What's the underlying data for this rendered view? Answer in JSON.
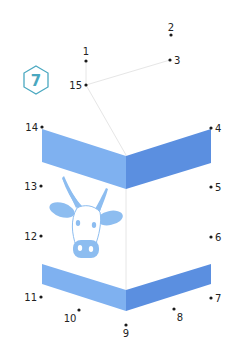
{
  "puzzle": {
    "badge_number": "7",
    "badge_color": "#4aa8c0",
    "dot_color": "#1a1a1a",
    "label_color": "#222222",
    "guide_line_color": "#e6e6e6",
    "band_left_color": "#7fb1f0",
    "band_right_color": "#5b8fe0",
    "cow_color": "#8dbdf0",
    "dots": [
      {
        "n": "1",
        "x": 86,
        "y": 61,
        "lx": 86,
        "ly": 55,
        "anchor": "middle"
      },
      {
        "n": "2",
        "x": 171,
        "y": 35,
        "lx": 171,
        "ly": 31,
        "anchor": "middle"
      },
      {
        "n": "3",
        "x": 170,
        "y": 60,
        "lx": 174,
        "ly": 64,
        "anchor": "start"
      },
      {
        "n": "4",
        "x": 211,
        "y": 128,
        "lx": 215,
        "ly": 132,
        "anchor": "start"
      },
      {
        "n": "5",
        "x": 211,
        "y": 187,
        "lx": 215,
        "ly": 191,
        "anchor": "start"
      },
      {
        "n": "6",
        "x": 211,
        "y": 237,
        "lx": 215,
        "ly": 241,
        "anchor": "start"
      },
      {
        "n": "7",
        "x": 211,
        "y": 298,
        "lx": 215,
        "ly": 302,
        "anchor": "start"
      },
      {
        "n": "8",
        "x": 174,
        "y": 309,
        "lx": 180,
        "ly": 321,
        "anchor": "middle"
      },
      {
        "n": "9",
        "x": 126,
        "y": 325,
        "lx": 126,
        "ly": 337,
        "anchor": "middle"
      },
      {
        "n": "10",
        "x": 79,
        "y": 310,
        "lx": 70,
        "ly": 322,
        "anchor": "middle"
      },
      {
        "n": "11",
        "x": 41,
        "y": 297,
        "lx": 37,
        "ly": 301,
        "anchor": "end"
      },
      {
        "n": "12",
        "x": 41,
        "y": 236,
        "lx": 37,
        "ly": 240,
        "anchor": "end"
      },
      {
        "n": "13",
        "x": 41,
        "y": 186,
        "lx": 37,
        "ly": 190,
        "anchor": "end"
      },
      {
        "n": "14",
        "x": 42,
        "y": 127,
        "lx": 38,
        "ly": 131,
        "anchor": "end"
      },
      {
        "n": "15",
        "x": 86,
        "y": 85,
        "lx": 82,
        "ly": 89,
        "anchor": "end"
      }
    ]
  }
}
